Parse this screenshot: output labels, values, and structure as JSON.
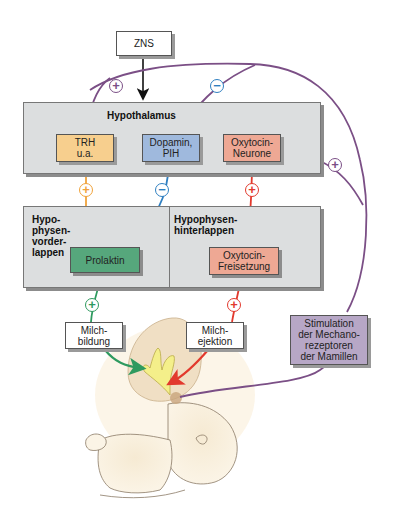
{
  "diagram": {
    "colors": {
      "feedback_purple": "#7b4f86",
      "trh_orange": "#f0a23a",
      "dopamine_blue": "#2f7fc1",
      "oxytocin_red": "#e2392d",
      "prolactin_green": "#2e9a5f",
      "region_gray": "#dcdedf"
    },
    "nodes": {
      "zns": "ZNS",
      "hypothalamus_title": "Hypothalamus",
      "trh": [
        "TRH",
        "u.a."
      ],
      "dopamin": [
        "Dopamin,",
        "PIH"
      ],
      "oxytocin_neurone": [
        "Oxytocin-",
        "Neurone"
      ],
      "hvl_title": [
        "Hypo-",
        "physen-",
        "vorder-",
        "lappen"
      ],
      "hhl_title": [
        "Hypophysen-",
        "hinterlappen"
      ],
      "prolaktin": "Prolaktin",
      "oxytocin_release": [
        "Oxytocin-",
        "Freisetzung"
      ],
      "milchbildung": [
        "Milch-",
        "bildung"
      ],
      "milchejektion": [
        "Milch-",
        "ejektion"
      ],
      "stimulation": [
        "Stimulation",
        "der Mechano-",
        "rezeptoren",
        "der Mamillen"
      ]
    },
    "signs": {
      "to_trh": "+",
      "to_dopamin": "−",
      "to_oxytocin_neurone": "+",
      "trh_to_prolaktin": "+",
      "dopamin_to_prolaktin": "−",
      "oxy_neurone_to_release": "+",
      "prolaktin_to_milchbildung": "+",
      "release_to_milchejektion": "+"
    }
  }
}
